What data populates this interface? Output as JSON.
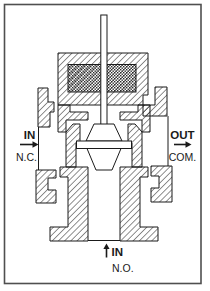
{
  "diagram": {
    "ports": {
      "left": {
        "label": "IN",
        "sub_label": "N.C.",
        "arrow_direction": "right"
      },
      "right": {
        "label": "OUT",
        "sub_label": "COM.",
        "arrow_direction": "right"
      },
      "bottom": {
        "label": "IN",
        "sub_label": "N.O.",
        "arrow_direction": "up"
      }
    },
    "colors": {
      "ink": "#1a1a1a",
      "background": "#ffffff",
      "border": "#4f4f4f"
    }
  }
}
